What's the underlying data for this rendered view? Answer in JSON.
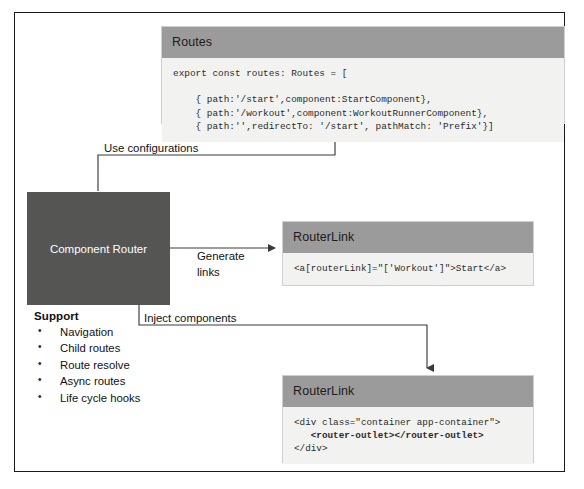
{
  "diagram": {
    "colors": {
      "frame_border": "#1a1a1a",
      "panel_header": "#9b9b9b",
      "panel_body": "#f2f2f0",
      "node_fill": "#555553",
      "node_text": "#ffffff",
      "edge": "#3a3a3a"
    }
  },
  "routes_panel": {
    "header": "Routes",
    "code": "export const routes: Routes = [\n\n    { path:'/start',component:StartComponent},\n    { path:'/workout',component:WorkoutRunnerComponent},\n    { path:'',redirectTo: '/start', pathMatch: 'Prefix'}]"
  },
  "router_node": {
    "label": "Component Router"
  },
  "support": {
    "title": "Support",
    "items": [
      "Navigation",
      "Child routes",
      "Route resolve",
      "Async routes",
      "Life cycle hooks"
    ]
  },
  "routerlink_panel_1": {
    "header": "RouterLink",
    "code": "<a[routerLink]=\"['Workout']\">Start</a>"
  },
  "routerlink_panel_2": {
    "header": "RouterLink",
    "code_line_1": "<div class=\"container app-container\">",
    "code_line_2": "   <router-outlet></router-outlet>",
    "code_line_3": "</div>"
  },
  "edges": {
    "use_configurations": "Use configurations",
    "generate_links": "Generate\nlinks",
    "inject_components": "Inject components"
  }
}
